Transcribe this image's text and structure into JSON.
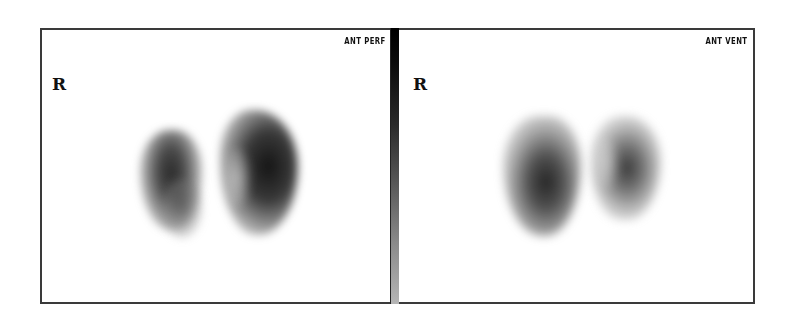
{
  "panels": [
    {
      "id": "perfusion",
      "label": "ANT PERF",
      "side_marker": "R"
    },
    {
      "id": "ventilation",
      "label": "ANT VENT",
      "side_marker": "R"
    }
  ],
  "gray_scale": {
    "top_color": "#000000",
    "bottom_color": "#b5b5b5"
  },
  "colors": {
    "background": "#ffffff",
    "border": "#3a3a3a",
    "text": "#111111"
  }
}
